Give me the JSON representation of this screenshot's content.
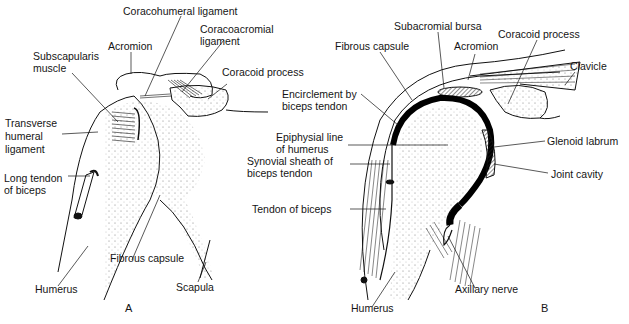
{
  "figure": {
    "panels": [
      {
        "id": "A",
        "letter": "A",
        "labels": {
          "coracohumeral": "Coracohumeral ligament",
          "coracoacromial_1": "Coracoacromial",
          "coracoacromial_2": "ligament",
          "acromion": "Acromion",
          "subscapularis_1": "Subscapularis",
          "subscapularis_2": "muscle",
          "coracoid": "Coracoid process",
          "transverse_1": "Transverse",
          "transverse_2": "humeral",
          "transverse_3": "ligament",
          "long_tendon_1": "Long tendon",
          "long_tendon_2": "of biceps",
          "fibrous_capsule": "Fibrous capsule",
          "humerus": "Humerus",
          "scapula": "Scapula"
        }
      },
      {
        "id": "B",
        "letter": "B",
        "labels": {
          "subacromial_bursa": "Subacromial bursa",
          "fibrous_capsule": "Fibrous capsule",
          "acromion": "Acromion",
          "coracoid": "Coracoid process",
          "clavicle": "Clavicle",
          "encirclement_1": "Encirclement by",
          "encirclement_2": "biceps tendon",
          "epiphysial_1": "Epiphysial line",
          "epiphysial_2": "of humerus",
          "synovial_1": "Synovial sheath of",
          "synovial_2": "biceps tendon",
          "glenoid_labrum": "Glenoid labrum",
          "joint_cavity": "Joint cavity",
          "tendon_biceps": "Tendon of biceps",
          "humerus": "Humerus",
          "axillary_nerve": "Axillary nerve"
        }
      }
    ]
  }
}
